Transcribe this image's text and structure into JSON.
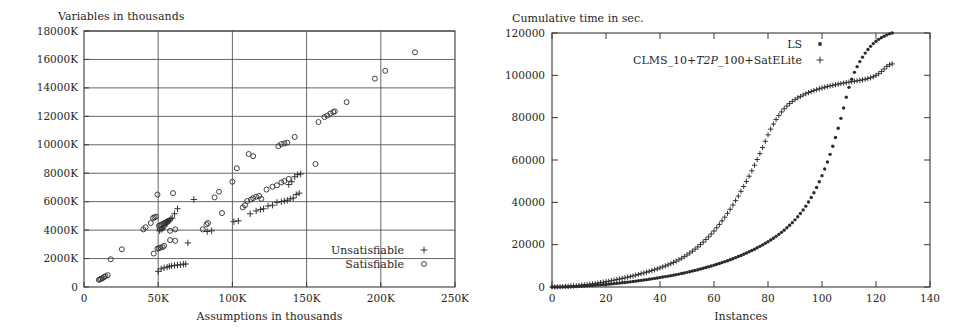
{
  "figures": [
    {
      "id": "scatter-assumptions-variables",
      "chart_data": {
        "type": "scatter",
        "title": "",
        "ylabel": "Variables in thousands",
        "xlabel": "Assumptions in thousands",
        "xlim": [
          0,
          250000
        ],
        "ylim": [
          0,
          18000
        ],
        "grid": true,
        "legend_position": "bottom-right",
        "xticks": [
          0,
          50000,
          100000,
          150000,
          200000,
          250000
        ],
        "xtick_labels": [
          "0",
          "50K",
          "100K",
          "150K",
          "200K",
          "250K"
        ],
        "yticks": [
          0,
          2000,
          4000,
          6000,
          8000,
          10000,
          12000,
          14000,
          16000,
          18000
        ],
        "ytick_labels": [
          "0",
          "2000K",
          "4000K",
          "6000K",
          "8000K",
          "10000K",
          "12000K",
          "14000K",
          "16000K",
          "18000K"
        ],
        "series": [
          {
            "name": "Unsatisfiable",
            "marker": "plus",
            "points": [
              [
                50000,
                1100
              ],
              [
                52000,
                1280
              ],
              [
                54000,
                1350
              ],
              [
                56000,
                1400
              ],
              [
                57500,
                1450
              ],
              [
                59000,
                1480
              ],
              [
                61000,
                1520
              ],
              [
                63000,
                1550
              ],
              [
                65000,
                1560
              ],
              [
                67000,
                1600
              ],
              [
                68500,
                1620
              ],
              [
                51000,
                3950
              ],
              [
                52500,
                4050
              ],
              [
                53500,
                4150
              ],
              [
                54500,
                4300
              ],
              [
                55500,
                4450
              ],
              [
                56500,
                4600
              ],
              [
                57500,
                4700
              ],
              [
                58500,
                4800
              ],
              [
                59500,
                4850
              ],
              [
                61000,
                5150
              ],
              [
                63000,
                5500
              ],
              [
                70000,
                3100
              ],
              [
                74000,
                6150
              ],
              [
                83000,
                3900
              ],
              [
                86000,
                3950
              ],
              [
                101000,
                4600
              ],
              [
                104000,
                4650
              ],
              [
                112000,
                5150
              ],
              [
                116000,
                5350
              ],
              [
                119000,
                5450
              ],
              [
                121000,
                5500
              ],
              [
                124000,
                5700
              ],
              [
                127000,
                5750
              ],
              [
                130000,
                5950
              ],
              [
                133000,
                6000
              ],
              [
                135000,
                6050
              ],
              [
                137000,
                6100
              ],
              [
                139000,
                6200
              ],
              [
                141000,
                6250
              ],
              [
                143000,
                6500
              ],
              [
                145000,
                6600
              ],
              [
                138000,
                7200
              ],
              [
                140000,
                7400
              ],
              [
                142000,
                7750
              ],
              [
                144000,
                7900
              ],
              [
                146000,
                7950
              ]
            ]
          },
          {
            "name": "Satisfiable",
            "marker": "circle",
            "points": [
              [
                10000,
                500
              ],
              [
                10800,
                540
              ],
              [
                11500,
                580
              ],
              [
                12500,
                620
              ],
              [
                13500,
                700
              ],
              [
                14500,
                760
              ],
              [
                16000,
                830
              ],
              [
                18000,
                1950
              ],
              [
                25500,
                2650
              ],
              [
                47000,
                2350
              ],
              [
                49500,
                2700
              ],
              [
                50500,
                2720
              ],
              [
                51500,
                2780
              ],
              [
                53000,
                2800
              ],
              [
                54000,
                2900
              ],
              [
                58000,
                3300
              ],
              [
                61500,
                3250
              ],
              [
                40000,
                4050
              ],
              [
                41500,
                4200
              ],
              [
                45000,
                4500
              ],
              [
                46500,
                4850
              ],
              [
                47500,
                4900
              ],
              [
                48500,
                4950
              ],
              [
                50500,
                4300
              ],
              [
                51500,
                4350
              ],
              [
                52500,
                4400
              ],
              [
                53500,
                4450
              ],
              [
                54500,
                4500
              ],
              [
                55500,
                4550
              ],
              [
                56000,
                4600
              ],
              [
                57000,
                4650
              ],
              [
                51000,
                4100
              ],
              [
                58000,
                3950
              ],
              [
                61500,
                4050
              ],
              [
                49500,
                6500
              ],
              [
                60000,
                6600
              ],
              [
                80000,
                4050
              ],
              [
                82500,
                4400
              ],
              [
                83500,
                4500
              ],
              [
                88000,
                6300
              ],
              [
                91000,
                6700
              ],
              [
                93000,
                5200
              ],
              [
                100000,
                7400
              ],
              [
                107000,
                5600
              ],
              [
                108500,
                5750
              ],
              [
                110000,
                6050
              ],
              [
                112500,
                6150
              ],
              [
                114000,
                6250
              ],
              [
                116000,
                6350
              ],
              [
                118000,
                6400
              ],
              [
                119500,
                6200
              ],
              [
                103000,
                8350
              ],
              [
                111000,
                9350
              ],
              [
                114000,
                9200
              ],
              [
                123000,
                6850
              ],
              [
                127000,
                7050
              ],
              [
                130000,
                7150
              ],
              [
                133000,
                7350
              ],
              [
                135000,
                7450
              ],
              [
                138000,
                7600
              ],
              [
                131000,
                9900
              ],
              [
                133000,
                10050
              ],
              [
                135000,
                10100
              ],
              [
                137000,
                10150
              ],
              [
                142000,
                10550
              ],
              [
                156000,
                8650
              ],
              [
                158000,
                11600
              ],
              [
                162000,
                11950
              ],
              [
                164000,
                12050
              ],
              [
                166000,
                12200
              ],
              [
                168000,
                12300
              ],
              [
                169000,
                12350
              ],
              [
                177000,
                13000
              ],
              [
                196000,
                14650
              ],
              [
                203000,
                15200
              ],
              [
                223000,
                16500
              ]
            ]
          }
        ]
      }
    },
    {
      "id": "cumulative-time-instances",
      "chart_data": {
        "type": "line",
        "title": "",
        "ylabel": "Cumulative time in sec.",
        "xlabel": "Instances",
        "xlim": [
          0,
          140
        ],
        "ylim": [
          0,
          120000
        ],
        "grid": false,
        "legend_position": "top-right",
        "xticks": [
          0,
          20,
          40,
          60,
          80,
          100,
          120,
          140
        ],
        "xtick_labels": [
          "0",
          "20",
          "40",
          "60",
          "80",
          "100",
          "120",
          "140"
        ],
        "yticks": [
          0,
          20000,
          40000,
          60000,
          80000,
          100000,
          120000
        ],
        "ytick_labels": [
          "0",
          "20000",
          "40000",
          "60000",
          "80000",
          "100000",
          "120000"
        ],
        "series": [
          {
            "name": "LS",
            "marker": "dot",
            "x_start": 0,
            "x_end": 126,
            "values": [
              0,
              10,
              25,
              45,
              70,
              100,
              140,
              185,
              235,
              290,
              350,
              415,
              485,
              560,
              640,
              725,
              815,
              910,
              1010,
              1115,
              1225,
              1340,
              1460,
              1585,
              1715,
              1850,
              1990,
              2135,
              2285,
              2440,
              2600,
              2765,
              2935,
              3110,
              3290,
              3475,
              3665,
              3860,
              4060,
              4265,
              4475,
              4690,
              4910,
              5135,
              5365,
              5600,
              5845,
              6100,
              6365,
              6640,
              6925,
              7220,
              7525,
              7840,
              8165,
              8500,
              8845,
              9200,
              9565,
              9940,
              10325,
              10720,
              11125,
              11545,
              11980,
              12430,
              12895,
              13375,
              13870,
              14380,
              14910,
              15460,
              16030,
              16620,
              17230,
              17860,
              18515,
              19195,
              19900,
              20635,
              21400,
              22200,
              23040,
              23920,
              24850,
              25830,
              26870,
              27970,
              29140,
              30390,
              31730,
              33170,
              34720,
              36390,
              38190,
              40140,
              42250,
              44540,
              47020,
              49700,
              52600,
              55720,
              59070,
              62670,
              66530,
              70650,
              75030,
              79670,
              84560,
              89690,
              94330,
              98200,
              101400,
              104100,
              106500,
              108600,
              110500,
              112200,
              113700,
              115000,
              116100,
              117000,
              117800,
              118500,
              119100,
              119600,
              120000
            ]
          },
          {
            "name": "CLMS_10+T2P_100+SatELite",
            "name_parts": [
              "CLMS_10+",
              "T2P",
              "_100+SatELite"
            ],
            "marker": "plus",
            "x_start": 0,
            "x_end": 126,
            "values": [
              0,
              30,
              70,
              120,
              180,
              250,
              330,
              420,
              520,
              630,
              750,
              880,
              1020,
              1170,
              1330,
              1500,
              1680,
              1870,
              2070,
              2280,
              2500,
              2730,
              2970,
              3220,
              3480,
              3750,
              4030,
              4320,
              4620,
              4930,
              5250,
              5580,
              5920,
              6270,
              6630,
              7000,
              7380,
              7770,
              8170,
              8590,
              9030,
              9490,
              9970,
              10480,
              11020,
              11600,
              12220,
              12880,
              13590,
              14350,
              15160,
              16020,
              16930,
              17900,
              18930,
              20020,
              21170,
              22390,
              23680,
              25040,
              26470,
              27980,
              29570,
              31240,
              32990,
              34820,
              36730,
              38720,
              40790,
              42940,
              45170,
              47480,
              49870,
              52340,
              54890,
              57520,
              60230,
              63020,
              65890,
              68840,
              71870,
              74590,
              76970,
              79100,
              81000,
              82700,
              84200,
              85500,
              86650,
              87650,
              88550,
              89350,
              90050,
              90700,
              91300,
              91850,
              92350,
              92800,
              93220,
              93620,
              94000,
              94350,
              94680,
              95000,
              95300,
              95580,
              95850,
              96100,
              96340,
              96570,
              96790,
              97000,
              97210,
              97420,
              97640,
              97880,
              98150,
              98470,
              98860,
              99350,
              99980,
              100780,
              101780,
              102950,
              104200,
              105000,
              105400
            ]
          }
        ]
      }
    }
  ]
}
